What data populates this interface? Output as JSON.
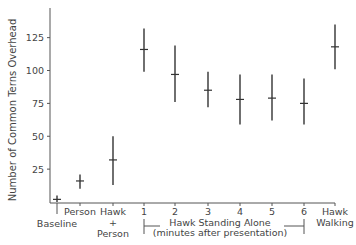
{
  "chart_data": {
    "type": "scatter",
    "subtype": "mean-with-range-error-bars",
    "title": "",
    "xlabel": "",
    "ylabel": "Number of Common Terns Overhead",
    "ylim": [
      0,
      145
    ],
    "yticks": [
      25,
      50,
      75,
      100,
      125
    ],
    "grid": false,
    "legend": null,
    "categories": [
      {
        "label": "Baseline",
        "lines": [
          "",
          "Baseline"
        ]
      },
      {
        "label": "Person",
        "lines": [
          "Person"
        ]
      },
      {
        "label": "Hawk + Person",
        "lines": [
          "Hawk",
          "+",
          "Person"
        ]
      },
      {
        "label": "1",
        "lines": [
          "1"
        ]
      },
      {
        "label": "2",
        "lines": [
          "2"
        ]
      },
      {
        "label": "3",
        "lines": [
          "3"
        ]
      },
      {
        "label": "4",
        "lines": [
          "4"
        ]
      },
      {
        "label": "5",
        "lines": [
          "5"
        ]
      },
      {
        "label": "6",
        "lines": [
          "6"
        ]
      },
      {
        "label": "Hawk Walking",
        "lines": [
          "Hawk",
          "Walking"
        ]
      }
    ],
    "series": [
      {
        "name": "Terns overhead",
        "values": [
          2,
          16,
          32,
          116,
          97,
          85,
          78,
          79,
          75,
          118
        ],
        "lower": [
          0,
          10,
          13,
          99,
          76,
          72,
          59,
          62,
          59,
          101
        ],
        "upper": [
          5,
          21,
          50,
          132,
          119,
          99,
          97,
          97,
          94,
          135
        ]
      }
    ],
    "annotations": [
      {
        "text_lines": [
          "Hawk Standing Alone",
          "(minutes after presentation)"
        ],
        "spans": [
          "1",
          "6"
        ],
        "type": "bracket"
      }
    ]
  }
}
